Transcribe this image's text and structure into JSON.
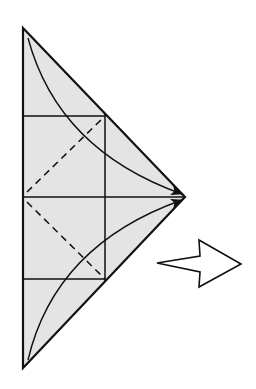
{
  "diagram": {
    "type": "origami-fold-step",
    "description": "Triangle with crease lines; fold top and bottom corners to the right vertex, then turn over / next step arrow",
    "colors": {
      "paper_fill": "#e4e4e4",
      "line": "#111111",
      "background": "#ffffff",
      "arrow_fill": "#ffffff"
    },
    "shape": {
      "vertices": {
        "top": [
          23,
          28
        ],
        "right": [
          185,
          197
        ],
        "bottom": [
          23,
          368
        ]
      }
    },
    "creases": {
      "horizontal_solid": [
        116,
        197,
        279
      ],
      "vertical_solid_x": 105,
      "dashed": [
        {
          "from": [
            27,
            192
          ],
          "to": [
            105,
            116
          ]
        },
        {
          "from": [
            27,
            202
          ],
          "to": [
            105,
            279
          ]
        }
      ]
    },
    "fold_arrows": [
      {
        "name": "top-corner-fold",
        "from": [
          28,
          38
        ],
        "to": [
          182,
          194
        ]
      },
      {
        "name": "bottom-corner-fold",
        "from": [
          28,
          360
        ],
        "to": [
          182,
          200
        ]
      }
    ],
    "next_step_arrow": {
      "direction": "right",
      "points": [
        [
          157,
          263
        ],
        [
          200,
          256
        ],
        [
          199,
          240
        ],
        [
          241,
          264
        ],
        [
          199,
          287
        ],
        [
          200,
          272
        ]
      ]
    }
  }
}
